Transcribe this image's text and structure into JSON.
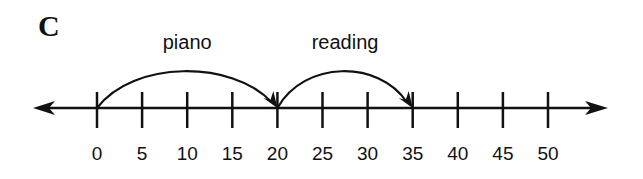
{
  "panel_label": "C",
  "number_line": {
    "min": 0,
    "max": 50,
    "step": 5,
    "ticks": [
      "0",
      "5",
      "10",
      "15",
      "20",
      "25",
      "30",
      "35",
      "40",
      "45",
      "50"
    ]
  },
  "jumps": [
    {
      "label": "piano",
      "from": 0,
      "to": 20
    },
    {
      "label": "reading",
      "from": 20,
      "to": 35
    }
  ],
  "colors": {
    "ink": "#111111",
    "background": "#ffffff"
  }
}
